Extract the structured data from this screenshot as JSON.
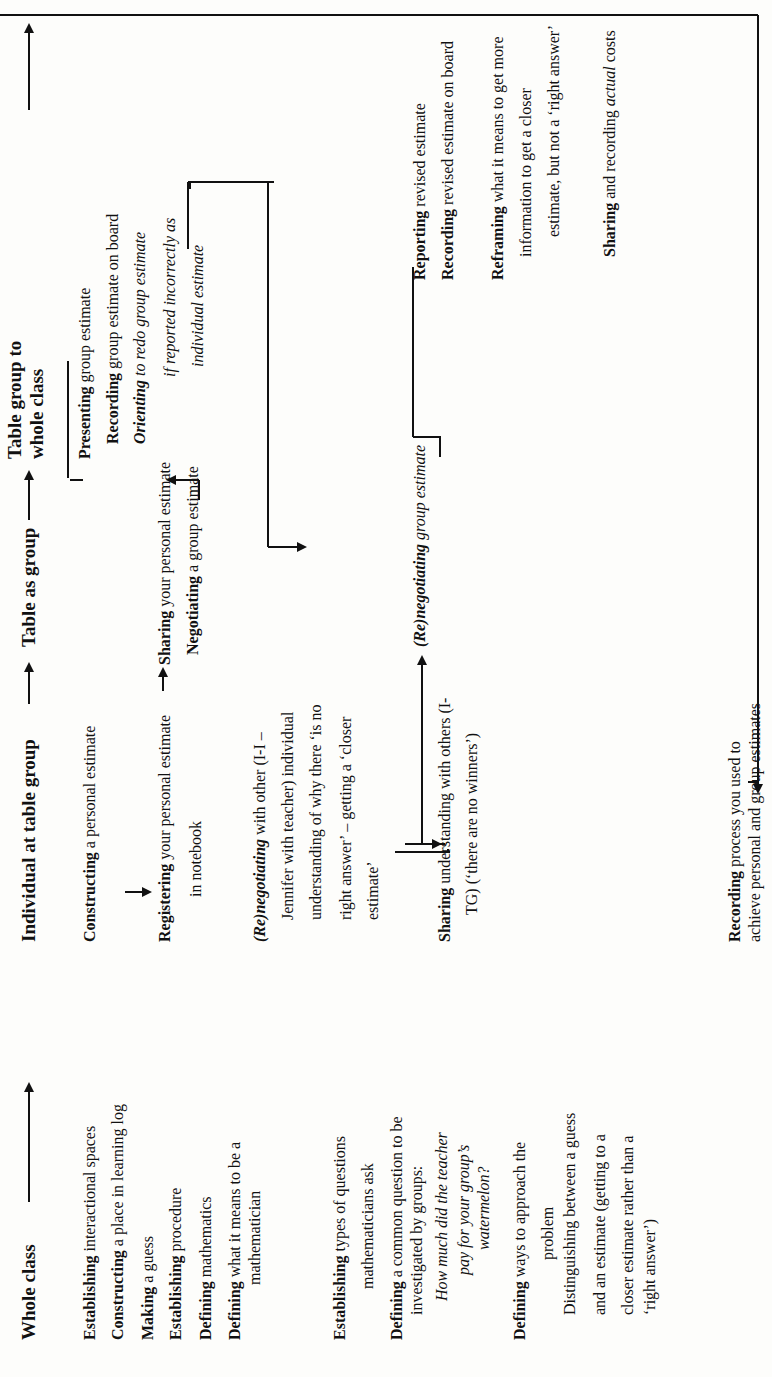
{
  "diagram": {
    "columns": [
      {
        "id": "whole_class",
        "header": "Whole class"
      },
      {
        "id": "individual",
        "header": "Individual at table group"
      },
      {
        "id": "table_group",
        "header": "Table as group"
      },
      {
        "id": "table_to_class",
        "header_line1": "Table group to",
        "header_line2": "whole class"
      }
    ],
    "whole_class": {
      "items": [
        {
          "verb": "Establishing",
          "rest": " interactional spaces"
        },
        {
          "verb": "Constructing",
          "rest": " a place in learning log"
        },
        {
          "verb": "Making",
          "rest": " a guess"
        },
        {
          "verb": "Establishing",
          "rest": " procedure"
        },
        {
          "verb": "Defining",
          "rest": " mathematics"
        },
        {
          "verb": "Defining",
          "rest": " what it means to be a",
          "cont": "mathematician"
        },
        {
          "verb": "Establishing",
          "rest": " types of questions",
          "cont": "mathematicians ask"
        },
        {
          "verb": "Defining",
          "rest": " a common question to be",
          "cont": "investigated by groups:",
          "question_lines": [
            "How much did the teacher",
            "pay for your group’s",
            "watermelon?"
          ]
        },
        {
          "verb": "Defining",
          "rest": " ways to approach the",
          "cont": "problem"
        },
        {
          "plain_lines": [
            "Distinguishing between a guess",
            "and an estimate (getting to a",
            "closer estimate rather than a",
            "‘right answer’)"
          ]
        }
      ]
    },
    "individual": {
      "constructing": {
        "verb": "Constructing",
        "rest": " a personal estimate"
      },
      "registering": {
        "verb": "Registering",
        "rest": " your personal estimate",
        "cont": "in notebook"
      },
      "renegotiating": {
        "verb": "(Re)negotiating",
        "rest": " with other (I-I –",
        "cont_lines": [
          "Jennifer with teacher) individual",
          "understanding of why there ‘is no",
          "right answer’ – getting a ‘closer",
          "estimate’"
        ]
      },
      "sharing": {
        "verb": "Sharing",
        "rest": " understanding with others (I-",
        "cont": "TG) (‘there are no winners’)"
      },
      "recording": {
        "verb": "Recording",
        "rest": " process you used to",
        "cont": "achieve personal and group estimates"
      }
    },
    "table_group": {
      "sharing": {
        "verb": "Sharing",
        "rest": " your personal estimate"
      },
      "negotiating": {
        "verb": "Negotiating",
        "rest": " a group estimate"
      },
      "renegotiating": {
        "verb": "(Re)negotiating",
        "rest": " group estimate"
      }
    },
    "table_to_class": {
      "presenting": {
        "verb": "Presenting",
        "rest": " group estimate"
      },
      "recording": {
        "verb": "Recording",
        "rest": " group estimate on board"
      },
      "orienting": {
        "verb": "Orienting",
        "rest": " to redo group estimate",
        "cont_lines": [
          "if reported incorrectly as",
          "individual estimate"
        ]
      },
      "reporting": {
        "verb": "Reporting",
        "rest": " revised estimate"
      },
      "recording_revised": {
        "verb": "Recording",
        "rest": " revised estimate on board"
      },
      "reframing": {
        "verb": "Reframing",
        "rest": " what it means to get more",
        "cont_lines": [
          "information to get a closer",
          "estimate, but not a ‘right answer’"
        ]
      },
      "sharing_costs": {
        "verb": "Sharing",
        "rest": " and recording ",
        "italic": "actual",
        "tail": " costs"
      }
    },
    "colors": {
      "ink": "#111111",
      "paper": "#fdfdfb"
    }
  }
}
